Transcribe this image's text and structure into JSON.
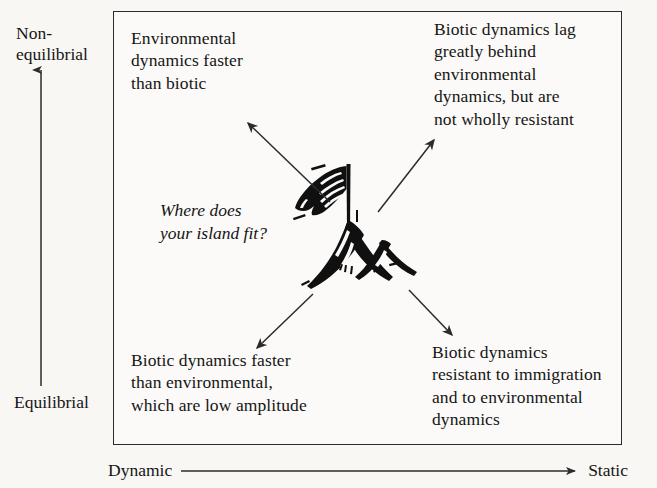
{
  "figure": {
    "background_color": "#f8f7f4",
    "ink_color": "#1a1a1a"
  },
  "axes": {
    "y": {
      "top_label": "Non-\nequilibrial",
      "bottom_label": "Equilibrial",
      "direction": "upward-arrow"
    },
    "x": {
      "start_label": "Dynamic",
      "end_label": "Static",
      "direction": "rightward-arrow"
    }
  },
  "quadrants": [
    {
      "position": "top-left",
      "text": "Environmental\ndynamics faster\nthan biotic"
    },
    {
      "position": "top-right",
      "text": "Biotic dynamics lag\ngreatly behind\nenvironmental\ndynamics, but are\nnot wholly resistant"
    },
    {
      "position": "bottom-left",
      "text": "Biotic dynamics faster\nthan environmental,\nwhich are low amplitude"
    },
    {
      "position": "bottom-right",
      "text": "Biotic dynamics\nresistant to immigration\nand to environmental\ndynamics"
    }
  ],
  "center": {
    "prompt": "Where does\nyour island fit?",
    "illustration": "mountain-with-flag-icon"
  },
  "arrows": [
    {
      "name": "arrow-to-top-left",
      "from": [
        330,
        202
      ],
      "to": [
        248,
        123
      ]
    },
    {
      "name": "arrow-to-top-right",
      "from": [
        378,
        212
      ],
      "to": [
        434,
        140
      ]
    },
    {
      "name": "arrow-to-bottom-left",
      "from": [
        313,
        294
      ],
      "to": [
        257,
        348
      ]
    },
    {
      "name": "arrow-to-bottom-right",
      "from": [
        409,
        290
      ],
      "to": [
        452,
        335
      ]
    }
  ]
}
